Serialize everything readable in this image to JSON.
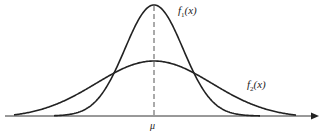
{
  "diagram": {
    "title": "",
    "type": "normal-distribution-comparison",
    "axis": {
      "x_label": "μ",
      "arrow": true
    },
    "mean_line": {
      "style": "dashed",
      "position": "μ"
    },
    "curves": [
      {
        "name": "f1",
        "label_base": "f",
        "label_sub": "1",
        "label_arg": "(x)",
        "description": "narrow, tall normal curve (smaller variance)"
      },
      {
        "name": "f2",
        "label_base": "f",
        "label_sub": "2",
        "label_arg": "(x)",
        "description": "wide, flat normal curve (larger variance)"
      }
    ],
    "colors": {
      "stroke": "#222222",
      "background": "#ffffff",
      "dash": "#555555"
    }
  },
  "chart_data": {
    "type": "line",
    "title": "",
    "xlabel": "μ",
    "ylabel": "",
    "series": [
      {
        "name": "f1(x)",
        "mean": 0,
        "relative_peak": 1.0,
        "relative_sd": 1.0
      },
      {
        "name": "f2(x)",
        "mean": 0,
        "relative_peak": 0.5,
        "relative_sd": 2.0
      }
    ],
    "x_ticks": [
      "μ"
    ],
    "grid": false,
    "legend": "inline labels"
  }
}
